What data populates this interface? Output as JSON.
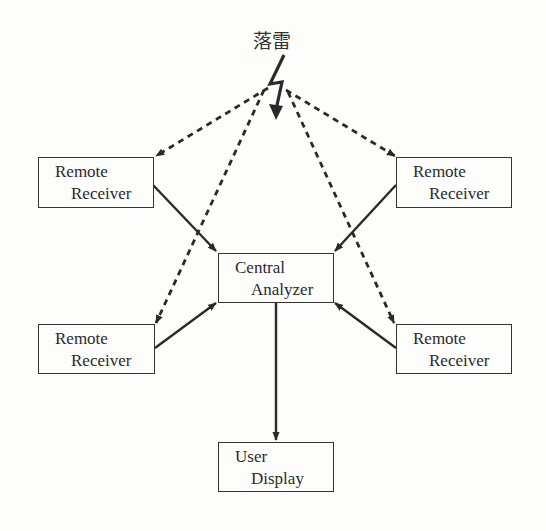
{
  "diagram": {
    "title": "落雷",
    "lightning_icon": "lightning-bolt-icon",
    "nodes": {
      "remote_top_left": {
        "line1": "Remote",
        "line2": "Receiver"
      },
      "remote_top_right": {
        "line1": "Remote",
        "line2": "Receiver"
      },
      "remote_bottom_left": {
        "line1": "Remote",
        "line2": "Receiver"
      },
      "remote_bottom_right": {
        "line1": "Remote",
        "line2": "Receiver"
      },
      "central": {
        "line1": "Central",
        "line2": "Analyzer"
      },
      "display": {
        "line1": "User",
        "line2": "Display"
      }
    },
    "edges": [
      {
        "from": "lightning",
        "to": "remote_top_left",
        "style": "dashed"
      },
      {
        "from": "lightning",
        "to": "remote_top_right",
        "style": "dashed"
      },
      {
        "from": "lightning",
        "to": "remote_bottom_left",
        "style": "dashed"
      },
      {
        "from": "lightning",
        "to": "remote_bottom_right",
        "style": "dashed"
      },
      {
        "from": "remote_top_left",
        "to": "central",
        "style": "solid"
      },
      {
        "from": "remote_top_right",
        "to": "central",
        "style": "solid"
      },
      {
        "from": "remote_bottom_left",
        "to": "central",
        "style": "solid"
      },
      {
        "from": "remote_bottom_right",
        "to": "central",
        "style": "solid"
      },
      {
        "from": "central",
        "to": "display",
        "style": "solid"
      }
    ],
    "colors": {
      "line": "#2a2a2a",
      "background": "#fdfdfb"
    }
  }
}
